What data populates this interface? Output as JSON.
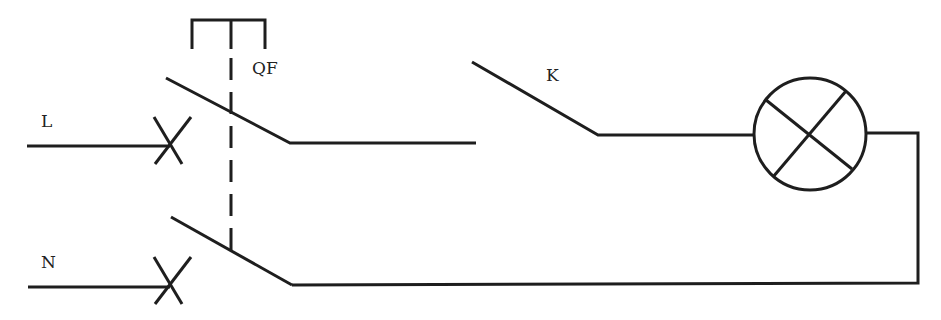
{
  "diagram": {
    "type": "electrical-circuit",
    "labels": {
      "line": "L",
      "neutral": "N",
      "breaker": "QF",
      "switch": "K"
    },
    "components": [
      {
        "id": "QF",
        "kind": "double-pole circuit breaker with mechanical linkage (dashed)"
      },
      {
        "id": "K",
        "kind": "single-pole switch (open)"
      },
      {
        "id": "lamp",
        "kind": "lamp (circle with X)"
      }
    ],
    "colors": {
      "line": "#1e1e1e",
      "background": "#ffffff"
    }
  }
}
